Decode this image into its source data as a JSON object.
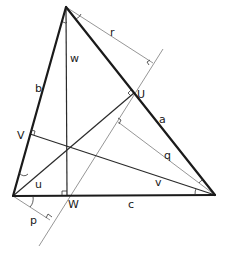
{
  "diagram": {
    "type": "triangle-geometry",
    "labels": {
      "side_a": "a",
      "side_b": "b",
      "side_c": "c",
      "point_U": "U",
      "point_V": "V",
      "point_W": "W",
      "seg_w": "w",
      "seg_r": "r",
      "seg_q": "q",
      "seg_p": "p",
      "angle_u": "u",
      "angle_v": "v"
    },
    "colors": {
      "sides": "#1a1a1a",
      "altitudes": "#2a2a2a",
      "construction": "#8a8a8a"
    }
  }
}
